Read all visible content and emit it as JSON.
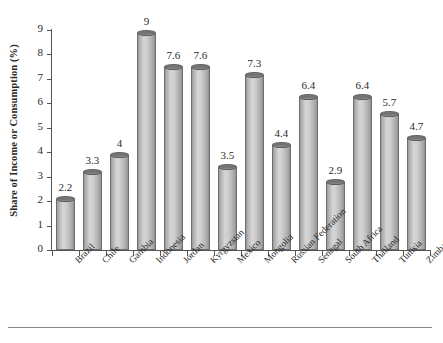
{
  "chart_data": {
    "type": "bar",
    "title": "",
    "xlabel": "",
    "ylabel": "Share of Income or Consumption (%)",
    "ylim": [
      0,
      9
    ],
    "ytick_labels": [
      "0",
      "1",
      "2",
      "3",
      "4",
      "5",
      "6",
      "7",
      "8",
      "9"
    ],
    "ytick_values": [
      0,
      1,
      2,
      3,
      4,
      5,
      6,
      7,
      8,
      9
    ],
    "grid": false,
    "legend": false,
    "bar_style": "3d-cylinder",
    "bar_color": "#c4c4c4",
    "bar_edge_color": "#6e6e6e",
    "bar_top_color": "#717171",
    "data_labels_shown": true,
    "categories": [
      "Brazil",
      "Chile",
      "Gambia",
      "Indonesia",
      "Jordan",
      "Kyrgyzstan",
      "Mexico",
      "Mongolia",
      "Russian Federation",
      "Senegal",
      "South Africa",
      "Thailand",
      "Tunisia",
      "Zimbabwe"
    ],
    "values": [
      2.2,
      3.3,
      4,
      9,
      7.6,
      7.6,
      3.5,
      7.3,
      4.4,
      6.4,
      2.9,
      6.4,
      5.7,
      4.7
    ],
    "value_labels": [
      "2.2",
      "3.3",
      "4",
      "9",
      "7.6",
      "7.6",
      "3.5",
      "7.3",
      "4.4",
      "6.4",
      "2.9",
      "6.4",
      "5.7",
      "4.7"
    ]
  }
}
